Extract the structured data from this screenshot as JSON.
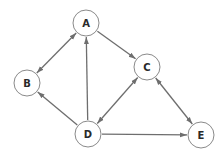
{
  "diagram": {
    "type": "directed-graph",
    "node_radius": 13,
    "colors": {
      "edge": "#6e6e6e",
      "node_stroke": "#8a8a8a",
      "node_fill": "#ffffff",
      "label": "#2a2a2a"
    },
    "nodes": [
      {
        "id": "A",
        "label": "A",
        "x": 86,
        "y": 23
      },
      {
        "id": "B",
        "label": "B",
        "x": 27,
        "y": 83
      },
      {
        "id": "C",
        "label": "C",
        "x": 147,
        "y": 67
      },
      {
        "id": "D",
        "label": "D",
        "x": 88,
        "y": 134
      },
      {
        "id": "E",
        "label": "E",
        "x": 201,
        "y": 135
      }
    ],
    "edges": [
      {
        "from": "A",
        "to": "B",
        "bidirectional": true
      },
      {
        "from": "A",
        "to": "C",
        "bidirectional": false
      },
      {
        "from": "D",
        "to": "A",
        "bidirectional": false
      },
      {
        "from": "D",
        "to": "B",
        "bidirectional": false
      },
      {
        "from": "D",
        "to": "C",
        "bidirectional": true
      },
      {
        "from": "C",
        "to": "E",
        "bidirectional": true
      },
      {
        "from": "D",
        "to": "E",
        "bidirectional": false
      }
    ]
  }
}
